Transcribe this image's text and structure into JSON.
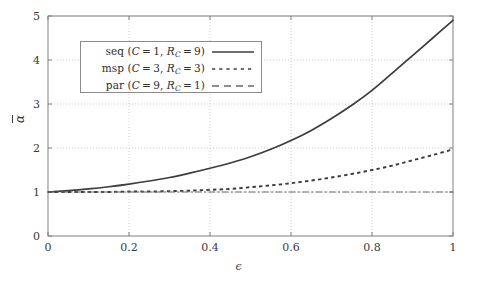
{
  "figure": {
    "background": "#ffffff",
    "axis_color": "#808080",
    "grid_color": "#c8c8c8",
    "curve_color": "#3c3c3c"
  },
  "axes": {
    "xlabel": "ϵ",
    "ylabel": "α",
    "ylabel_has_overbar": true,
    "xticks": [
      "0",
      "0.2",
      "0.4",
      "0.6",
      "0.8",
      "1"
    ],
    "yticks": [
      "0",
      "1",
      "2",
      "3",
      "4",
      "5"
    ]
  },
  "legend": {
    "entries": [
      {
        "text_plain": "seq (C = 1, R_C = 9)",
        "prefix": "seq",
        "c_value": "1",
        "rc_value": "9",
        "style": "solid"
      },
      {
        "text_plain": "msp (C = 3, R_C = 3)",
        "prefix": "msp",
        "c_value": "3",
        "rc_value": "3",
        "style": "dotted"
      },
      {
        "text_plain": "par (C = 9, R_C = 1)",
        "prefix": "par",
        "c_value": "9",
        "rc_value": "1",
        "style": "dashdot"
      }
    ]
  },
  "chart_data": {
    "type": "line",
    "title": "",
    "xlabel": "ϵ",
    "ylabel": "ᾱ",
    "xlim": [
      0,
      1
    ],
    "ylim": [
      0,
      5
    ],
    "xticks": [
      0,
      0.2,
      0.4,
      0.6,
      0.8,
      1
    ],
    "yticks": [
      0,
      1,
      2,
      3,
      4,
      5
    ],
    "grid": true,
    "legend_position": "upper-left-inside",
    "x": [
      0,
      0.05,
      0.1,
      0.15,
      0.2,
      0.25,
      0.3,
      0.35,
      0.4,
      0.45,
      0.5,
      0.55,
      0.6,
      0.65,
      0.7,
      0.75,
      0.8,
      0.85,
      0.9,
      0.95,
      1.0
    ],
    "series": [
      {
        "name": "seq (C = 1, R_C = 9)",
        "style": "solid",
        "color": "#3c3c3c",
        "values": [
          1.0,
          1.03,
          1.07,
          1.12,
          1.18,
          1.25,
          1.33,
          1.43,
          1.54,
          1.66,
          1.8,
          1.97,
          2.17,
          2.4,
          2.67,
          2.97,
          3.31,
          3.7,
          4.1,
          4.5,
          4.9
        ]
      },
      {
        "name": "msp (C = 3, R_C = 3)",
        "style": "dotted",
        "color": "#3c3c3c",
        "values": [
          1.0,
          1.0,
          1.0,
          1.0,
          1.01,
          1.01,
          1.02,
          1.03,
          1.05,
          1.07,
          1.11,
          1.15,
          1.2,
          1.26,
          1.33,
          1.41,
          1.5,
          1.6,
          1.72,
          1.84,
          1.97
        ]
      },
      {
        "name": "par (C = 9, R_C = 1)",
        "style": "dashdot",
        "color": "#6a6a6a",
        "values": [
          1.0,
          1.0,
          1.0,
          1.0,
          1.0,
          1.0,
          1.0,
          1.0,
          1.0,
          1.0,
          1.0,
          1.0,
          1.0,
          1.0,
          1.0,
          1.0,
          1.0,
          1.0,
          1.0,
          1.0,
          1.0
        ]
      }
    ]
  }
}
